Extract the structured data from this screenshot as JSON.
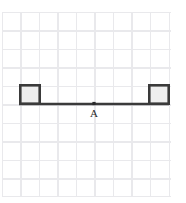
{
  "figure": {
    "background_color": "#ffffff",
    "width": 186,
    "height": 203
  },
  "grid": {
    "name": "graph-paper-grid",
    "line_color": "#e9e9ec",
    "cell_size": 18.5,
    "columns": 9,
    "rows": 10,
    "origin_x": 2,
    "origin_y": 12,
    "width": 169,
    "height": 185
  },
  "diagram": {
    "stroke_color": "#3a3a3a",
    "block_fill_color": "#eeeeee",
    "bar": {
      "name": "connecting-bar",
      "x1": 19,
      "y1": 104,
      "x2": 169,
      "y2": 104,
      "thickness": 2.6
    },
    "blocks": [
      {
        "name": "left-block",
        "x": 19,
        "y": 84,
        "width": 21,
        "height": 20
      },
      {
        "name": "right-block",
        "x": 148,
        "y": 84,
        "width": 21,
        "height": 20
      }
    ],
    "point": {
      "name": "point-a",
      "label": "A",
      "x": 94,
      "y": 103.5,
      "marker_size": 3.2,
      "label_x": 94,
      "label_y": 108
    }
  }
}
